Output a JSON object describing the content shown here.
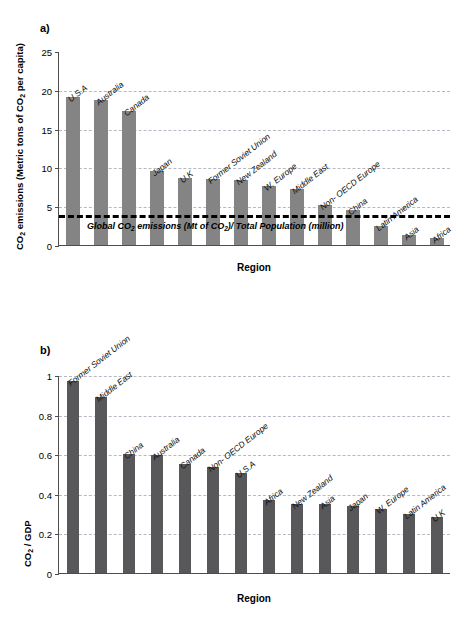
{
  "figure": {
    "panel_a_label": "a)",
    "panel_b_label": "b)"
  },
  "chart_data": [
    {
      "type": "bar",
      "panel": "a)",
      "title": "",
      "xlabel": "Region",
      "ylabel": "CO2 emissions (Metric tons of CO2 per capita)",
      "ylabel_parts": {
        "pre": "CO",
        "sub1": "2",
        "mid": " emissions (Metric tons of CO",
        "sub2": "2",
        "post": " per capita)"
      },
      "ylim": [
        0,
        25
      ],
      "yticks": [
        0,
        5,
        10,
        15,
        20,
        25
      ],
      "ytick_labels": [
        "0",
        "5",
        "10",
        "15",
        "20",
        "25"
      ],
      "grid": true,
      "grid_values": [
        5,
        10,
        15,
        20
      ],
      "bar_color": "#848484",
      "categories": [
        "U.S.A",
        "Australia",
        "Canada",
        "Japan",
        "U.K",
        "Former Soviet Union",
        "New Zealand",
        "W. Europe",
        "Middle East",
        "Non- OECD Europe",
        "China",
        "Latin America",
        "Asia",
        "Africa"
      ],
      "values": [
        19.1,
        18.7,
        17.3,
        9.6,
        8.6,
        8.5,
        8.4,
        7.6,
        7.2,
        5.1,
        4.5,
        2.4,
        1.3,
        0.85
      ],
      "annotation": {
        "value": 4.0,
        "text": "Global CO2 emissions (Mt of CO2)/ Total Population (million)",
        "text_parts": {
          "pre": "Global CO",
          "sub1": "2",
          "mid": " emissions (Mt of CO",
          "sub2": "2",
          "post": ")/ Total Population (million)"
        },
        "style": "dashed-black"
      }
    },
    {
      "type": "bar",
      "panel": "b)",
      "title": "",
      "xlabel": "Region",
      "ylabel": "CO2 / GDP",
      "ylabel_parts": {
        "pre": "CO",
        "sub1": "2",
        "post": " / GDP"
      },
      "ylim": [
        0,
        1
      ],
      "yticks": [
        0,
        0.2,
        0.4,
        0.6,
        0.8,
        1
      ],
      "ytick_labels": [
        "0",
        "0.2",
        "0.4",
        "0.6",
        "0.8",
        "1"
      ],
      "grid": true,
      "grid_values": [
        0.2,
        0.4,
        0.6,
        0.8,
        1
      ],
      "bar_color": "#58585a",
      "categories": [
        "Former Soviet Union",
        "Middle East",
        "China",
        "Australia",
        "Canada",
        "Non- OECD Europe",
        "U.S.A",
        "Africa",
        "New Zealand",
        "Asia",
        "Japan",
        "W. Europe",
        "Latin America",
        "U.K"
      ],
      "values": [
        0.97,
        0.89,
        0.6,
        0.595,
        0.55,
        0.535,
        0.505,
        0.37,
        0.35,
        0.348,
        0.34,
        0.322,
        0.3,
        0.285
      ]
    }
  ]
}
